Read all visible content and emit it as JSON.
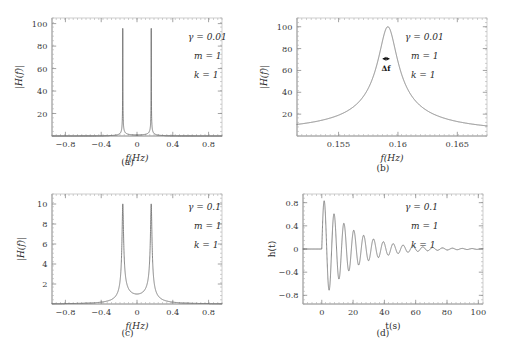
{
  "figure": {
    "caption_a": "(a)",
    "caption_b": "(b)",
    "caption_c": "(c)",
    "caption_d": "(d)",
    "curve_color": "#6f6f6f",
    "frame_color": "#b9b9b9",
    "text_color": "#2b2b2b"
  },
  "chart_data": [
    {
      "id": "panel-a",
      "type": "line",
      "title": "",
      "xlabel": "f(Hz)",
      "ylabel": "|H(f)|",
      "xlim": [
        -0.95,
        0.95
      ],
      "ylim": [
        0,
        105
      ],
      "xticks": [
        -0.8,
        -0.4,
        0,
        0.4,
        0.8
      ],
      "xticklabels": [
        "−0.8",
        "−0.4",
        "0",
        "0.4",
        "0.8"
      ],
      "yticks": [
        20,
        40,
        60,
        80,
        100
      ],
      "yticklabels": [
        "20",
        "40",
        "60",
        "80",
        "100"
      ],
      "grid": false,
      "legend": "none",
      "annotations": [
        "γ = 0.01",
        "m = 1",
        "k = 1"
      ],
      "params": {
        "gamma": 0.01,
        "m": 1,
        "k": 1
      },
      "resonance_freq_hz": 0.159,
      "peak_amplitude": 100,
      "description": "Magnitude of transfer function of a damped harmonic oscillator, two sharp resonance peaks at f = ±0.159 Hz reaching 100",
      "peaks": [
        {
          "x": -0.159,
          "y": 100
        },
        {
          "x": 0.159,
          "y": 100
        }
      ],
      "baseline": 1
    },
    {
      "id": "panel-b",
      "type": "line",
      "title": "",
      "xlabel": "f(Hz)",
      "ylabel": "|H(f)|",
      "xlim": [
        0.1515,
        0.1675
      ],
      "ylim": [
        0,
        108
      ],
      "xticks": [
        0.155,
        0.16,
        0.165
      ],
      "xticklabels": [
        "0.155",
        "0.16",
        "0.165"
      ],
      "yticks": [
        20,
        40,
        60,
        80,
        100
      ],
      "yticklabels": [
        "20",
        "40",
        "60",
        "80",
        "100"
      ],
      "grid": false,
      "legend": "none",
      "annotations": [
        "γ = 0.01",
        "m = 1",
        "k = 1"
      ],
      "params": {
        "gamma": 0.01,
        "m": 1,
        "k": 1
      },
      "resonance_freq_hz": 0.159,
      "peak_amplitude": 100,
      "bandwidth_label": "Δf",
      "bandwidth_level": 70.7,
      "description": "Zoomed view of the positive resonance peak showing the half-power bandwidth Δf near f = 0.159 Hz",
      "edge_amplitude": 6
    },
    {
      "id": "panel-c",
      "type": "line",
      "title": "",
      "xlabel": "f(Hz)",
      "ylabel": "|H(f)|",
      "xlim": [
        -0.95,
        0.95
      ],
      "ylim": [
        0,
        11
      ],
      "xticks": [
        -0.8,
        -0.4,
        0,
        0.4,
        0.8
      ],
      "xticklabels": [
        "−0.8",
        "−0.4",
        "0",
        "0.4",
        "0.8"
      ],
      "yticks": [
        2,
        4,
        6,
        8,
        10
      ],
      "yticklabels": [
        "2",
        "4",
        "6",
        "8",
        "10"
      ],
      "grid": false,
      "legend": "none",
      "annotations": [
        "γ = 0.1",
        "m = 1",
        "k = 1"
      ],
      "params": {
        "gamma": 0.1,
        "m": 1,
        "k": 1
      },
      "resonance_freq_hz": 0.159,
      "peak_amplitude": 10,
      "description": "Magnitude of transfer function with larger damping: two broader resonance peaks at f = ±0.159 Hz reaching 10",
      "peaks": [
        {
          "x": -0.159,
          "y": 10
        },
        {
          "x": 0.159,
          "y": 10
        }
      ],
      "baseline": 1
    },
    {
      "id": "panel-d",
      "type": "line",
      "title": "",
      "xlabel": "t(s)",
      "ylabel": "h(t)",
      "xlim": [
        -12,
        103
      ],
      "ylim": [
        -0.95,
        0.95
      ],
      "xticks": [
        0,
        20,
        40,
        60,
        80,
        100
      ],
      "xticklabels": [
        "0",
        "20",
        "40",
        "60",
        "80",
        "100"
      ],
      "yticks": [
        -0.8,
        -0.4,
        0,
        0.4,
        0.8
      ],
      "yticklabels": [
        "−0.8",
        "−0.4",
        "0",
        "0.4",
        "0.8"
      ],
      "grid": false,
      "legend": "none",
      "annotations": [
        "γ = 0.1",
        "m = 1",
        "k = 1"
      ],
      "params": {
        "gamma": 0.1,
        "m": 1,
        "k": 1
      },
      "description": "Impulse response h(t): exponentially damped sinusoid starting at t = 0, period ≈ 6.3 s, decay time constant ≈ 20 s, initial peak ≈ 0.9",
      "oscillation_period_s": 6.3,
      "decay_tau_s": 20,
      "initial_peak": 0.9,
      "zero_before_t0": true
    }
  ]
}
